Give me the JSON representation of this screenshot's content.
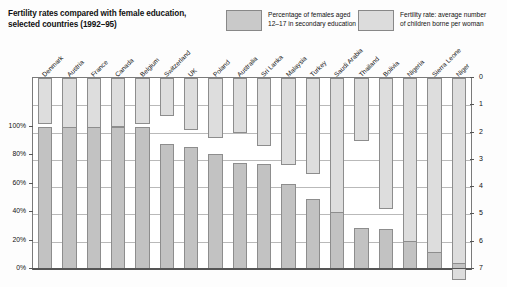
{
  "header": {
    "title": "Fertility rates compared with female education, selected countries (1992–95)",
    "legend": [
      {
        "key": "education",
        "swatch_color": "#c9c9c9",
        "label": "Percentage of females aged\n12–17 in secondary education"
      },
      {
        "key": "fertility",
        "swatch_color": "#dcdcdc",
        "label": "Fertility rate: average number\nof children borne per woman"
      }
    ]
  },
  "axes": {
    "left_title": "",
    "left_ticks": [
      "100%",
      "80%",
      "60%",
      "40%",
      "20%",
      "0%"
    ],
    "right_ticks": [
      "0",
      "1",
      "2",
      "3",
      "4",
      "5",
      "6",
      "7"
    ],
    "right_title": ""
  },
  "chart_data": {
    "type": "bar",
    "title": "Fertility rates compared with female education, selected countries (1992–95)",
    "xlabel": "",
    "ylabel": "Percentage of females aged 12–17 in secondary education",
    "y2label": "Fertility rate: average number of children borne per woman",
    "ylim": [
      0,
      100
    ],
    "y2lim": [
      0,
      7
    ],
    "y2_inverted": true,
    "grid": true,
    "legend_position": "top",
    "categories": [
      "Denmark",
      "Austria",
      "France",
      "Canada",
      "Belgium",
      "Switzerland",
      "UK",
      "Poland",
      "Australia",
      "Sri Lanka",
      "Malaysia",
      "Turkey",
      "Saudi Arabia",
      "Thailand",
      "Bolivia",
      "Nigeria",
      "Sierra Leone",
      "Niger"
    ],
    "series": [
      {
        "name": "Percentage of females aged 12–17 in secondary education",
        "unit": "%",
        "axis": "left",
        "color": "#c2c2c2",
        "values": [
          100,
          100,
          100,
          100,
          100,
          88,
          86,
          81,
          75,
          74,
          60,
          49,
          40,
          29,
          28,
          20,
          12,
          4
        ]
      },
      {
        "name": "Fertility rate: average number of children borne per woman",
        "unit": "children per woman",
        "axis": "right",
        "color": "#dddddd",
        "values": [
          1.7,
          2.1,
          1.9,
          1.8,
          1.7,
          1.4,
          1.9,
          2.2,
          2.0,
          2.5,
          3.2,
          3.5,
          6.4,
          2.3,
          4.8,
          6.6,
          6.5,
          7.4
        ]
      }
    ]
  }
}
